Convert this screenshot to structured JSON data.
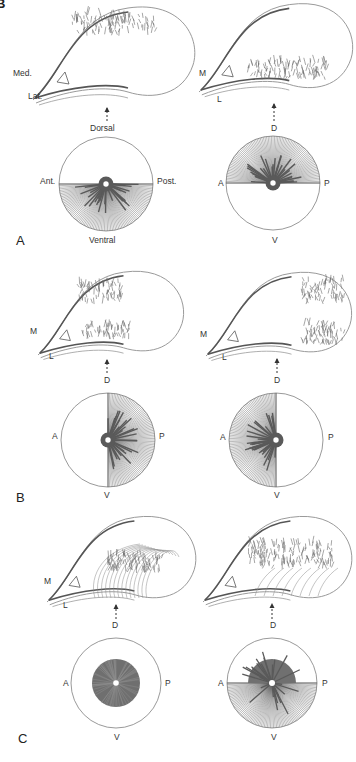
{
  "figure": {
    "corner_fragment": "B",
    "panels": [
      {
        "letter": "A",
        "left": {
          "retina_labels": {
            "medial": "Med.",
            "lateral": "Lat.",
            "dorsal": "Dorsal"
          },
          "disk_labels": {
            "anterior": "Ant.",
            "posterior": "Post.",
            "ventral": "Ventral"
          },
          "coverage": "ventral-half",
          "density_region": "upper-dorsal-rim"
        },
        "right": {
          "retina_labels": {
            "medial": "M",
            "lateral": "L",
            "dorsal": "D"
          },
          "disk_labels": {
            "anterior": "A",
            "posterior": "P",
            "ventral": "V"
          },
          "coverage": "dorsal-half",
          "density_region": "lower-ventral-rim"
        }
      },
      {
        "letter": "B",
        "left": {
          "retina_labels": {
            "medial": "M",
            "lateral": "L",
            "dorsal": "D"
          },
          "disk_labels": {
            "anterior": "A",
            "posterior": "P",
            "dorsal": "D",
            "ventral": "V"
          },
          "coverage": "posterior-half",
          "density_region": "nasal-upper-and-lower"
        },
        "right": {
          "retina_labels": {
            "medial": "M",
            "lateral": "L",
            "dorsal": "D"
          },
          "disk_labels": {
            "anterior": "A",
            "posterior": "P",
            "dorsal": "D",
            "ventral": "V"
          },
          "coverage": "anterior-half",
          "density_region": "temporal-tip"
        }
      },
      {
        "letter": "C",
        "left": {
          "retina_labels": {
            "medial": "M",
            "lateral": "L",
            "dorsal": "D"
          },
          "disk_labels": {
            "anterior": "A",
            "posterior": "P",
            "dorsal": "D",
            "ventral": "V"
          },
          "coverage": "central-disk",
          "density_region": "central-patch-with-arcs"
        },
        "right": {
          "retina_labels": {
            "dorsal": "D"
          },
          "disk_labels": {
            "anterior": "A",
            "posterior": "P",
            "dorsal": "D",
            "ventral": "V"
          },
          "coverage": "central-plus-ventral-half",
          "density_region": "upper-rim-with-arcs"
        }
      }
    ],
    "colors": {
      "line": "#555555",
      "fiber": "#6a6a6a",
      "dense": "#5a5a5a",
      "outline": "#9a9a9a"
    }
  }
}
